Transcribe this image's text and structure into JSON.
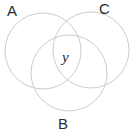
{
  "diagram": {
    "type": "venn-diagram",
    "set_count": 3,
    "canvas": {
      "width": 134,
      "height": 134,
      "background": "#ffffff"
    },
    "stroke_color": "#cccccc",
    "stroke_width": 1,
    "text_color": "#2b2b2b",
    "sets": [
      {
        "id": "A",
        "label": "A",
        "cx": 43,
        "cy": 51,
        "r": 38,
        "label_x": 7,
        "label_y": 3
      },
      {
        "id": "C",
        "label": "C",
        "cx": 91,
        "cy": 50,
        "r": 38,
        "label_x": 99,
        "label_y": 1
      },
      {
        "id": "B",
        "label": "B",
        "cx": 69,
        "cy": 73,
        "r": 38,
        "label_x": 58,
        "label_y": 116
      }
    ],
    "regions": [
      {
        "id": "center",
        "label": "y",
        "description": "intersection of A, B and C",
        "x": 62,
        "y": 50
      }
    ]
  }
}
